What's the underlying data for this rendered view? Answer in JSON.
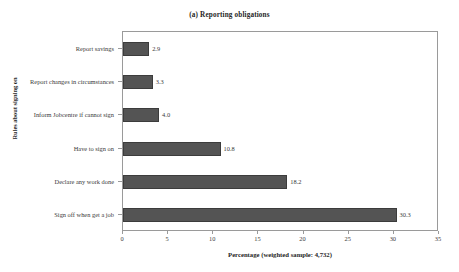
{
  "chart_data": {
    "type": "bar",
    "orientation": "horizontal",
    "title": "(a) Reporting obligations",
    "xlabel": "Percentage (weighted sample: 4,732)",
    "ylabel": "Rules about signing on",
    "categories": [
      "Sign off when get a job",
      "Declare any work done",
      "Have to sign on",
      "Inform Jobcentre if cannot sign",
      "Report changes in circumstances",
      "Report savings"
    ],
    "values": [
      30.3,
      18.2,
      10.8,
      4.0,
      3.3,
      2.9
    ],
    "data_labels": [
      "30.3",
      "18.2",
      "10.8",
      "4.0",
      "3.3",
      "2.9"
    ],
    "xlim": [
      0,
      35
    ],
    "xticks": [
      0,
      5,
      10,
      15,
      20,
      25,
      30,
      35
    ],
    "xtick_labels": [
      "0",
      "5",
      "10",
      "15",
      "20",
      "25",
      "30",
      "35"
    ],
    "grid": false,
    "legend": null,
    "bar_color": "#545454",
    "bar_edge_color": "#3c3c3c",
    "axis_color": "#9a9a9a",
    "text_color": "#3a3a3a"
  }
}
